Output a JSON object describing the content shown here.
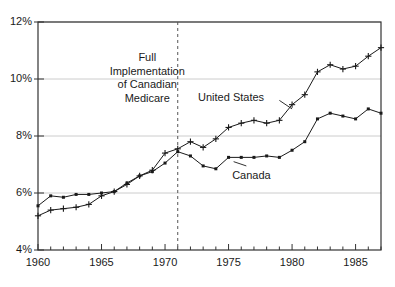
{
  "chart_data": {
    "type": "line",
    "title": "",
    "xlabel": "",
    "ylabel": "",
    "xlim": [
      1960,
      1987
    ],
    "ylim": [
      4,
      12
    ],
    "ytick_values": [
      4,
      6,
      8,
      10,
      12
    ],
    "ytick_labels": [
      "4%",
      "6%",
      "8%",
      "10%",
      "12%"
    ],
    "xtick_values": [
      1960,
      1965,
      1970,
      1975,
      1980,
      1985
    ],
    "xtick_labels": [
      "1960",
      "1965",
      "1970",
      "1975",
      "1980",
      "1985"
    ],
    "xtick_minor_step": 1,
    "grid": "horizontal",
    "legend_position": "inline-labels",
    "x": [
      1960,
      1961,
      1962,
      1963,
      1964,
      1965,
      1966,
      1967,
      1968,
      1969,
      1970,
      1971,
      1972,
      1973,
      1974,
      1975,
      1976,
      1977,
      1978,
      1979,
      1980,
      1981,
      1982,
      1983,
      1984,
      1985,
      1986,
      1987
    ],
    "series": [
      {
        "name": "United States",
        "marker": "plus",
        "color": "#1a1a1a",
        "values": [
          5.2,
          5.4,
          5.45,
          5.5,
          5.6,
          5.9,
          6.05,
          6.3,
          6.6,
          6.8,
          7.4,
          7.55,
          7.8,
          7.6,
          7.9,
          8.3,
          8.45,
          8.55,
          8.45,
          8.55,
          9.1,
          9.45,
          10.25,
          10.5,
          10.35,
          10.45,
          10.8,
          11.1
        ]
      },
      {
        "name": "Canada",
        "marker": "square",
        "color": "#1a1a1a",
        "values": [
          5.55,
          5.9,
          5.85,
          5.95,
          5.95,
          6.0,
          6.05,
          6.35,
          6.6,
          6.75,
          7.05,
          7.45,
          7.3,
          6.95,
          6.85,
          7.25,
          7.25,
          7.25,
          7.3,
          7.25,
          7.5,
          7.8,
          8.6,
          8.8,
          8.7,
          8.6,
          8.95,
          8.8
        ]
      }
    ],
    "annotations": [
      {
        "name": "medicare-annotation",
        "lines": [
          "Full",
          "Implementation",
          "of Canadian",
          "Medicare"
        ],
        "x_position": 1968.6,
        "y_position": 10.7
      }
    ],
    "reference_lines": [
      {
        "name": "full-implementation-line",
        "orientation": "vertical",
        "x_value": 1971,
        "style": "dashed",
        "color": "#555555"
      }
    ],
    "series_inline_labels": [
      {
        "name": "United States",
        "x_position": 1975.2,
        "y_position": 9.35
      },
      {
        "name": "Canada",
        "x_position": 1976.8,
        "y_position": 6.6
      }
    ]
  }
}
